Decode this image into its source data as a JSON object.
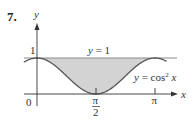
{
  "problem_number": "7.",
  "colors": {
    "shade": "#d3d3d3",
    "curve": "#555555",
    "line_y1": "#8a8a8a",
    "axis": "#333333",
    "text": "#333333"
  },
  "chart_data": {
    "type": "area",
    "title": "",
    "xlabel": "x",
    "ylabel": "y",
    "x_ticks": [
      {
        "value": 0,
        "label": "0"
      },
      {
        "value": 1.5708,
        "label": "π/2"
      },
      {
        "value": 3.1416,
        "label": "π"
      }
    ],
    "y_ticks": [
      {
        "value": 1,
        "label": "1"
      }
    ],
    "xlim": [
      -0.35,
      3.45
    ],
    "ylim": [
      0,
      1.9
    ],
    "grid": false,
    "series": [
      {
        "name": "y = 1",
        "expression": "1",
        "style": "line"
      },
      {
        "name": "y = cos² x",
        "expression": "cos(x)^2",
        "style": "curve"
      }
    ],
    "shaded_region": {
      "between": [
        "y = 1",
        "y = cos² x"
      ],
      "x_from": 0,
      "x_to": 3.1416
    },
    "annotations": [
      {
        "text": "y = 1",
        "near": "top line, center"
      },
      {
        "text": "y = cos² x",
        "near": "right side of curve"
      }
    ]
  },
  "labels": {
    "y_axis": "y",
    "x_axis": "x",
    "origin": "0",
    "one": "1",
    "pi_half_num": "π",
    "pi_half_den": "2",
    "pi": "π",
    "line_label": "y = 1",
    "curve_label_prefix": "y = cos",
    "curve_label_exp": "2",
    "curve_label_suffix": " x"
  }
}
